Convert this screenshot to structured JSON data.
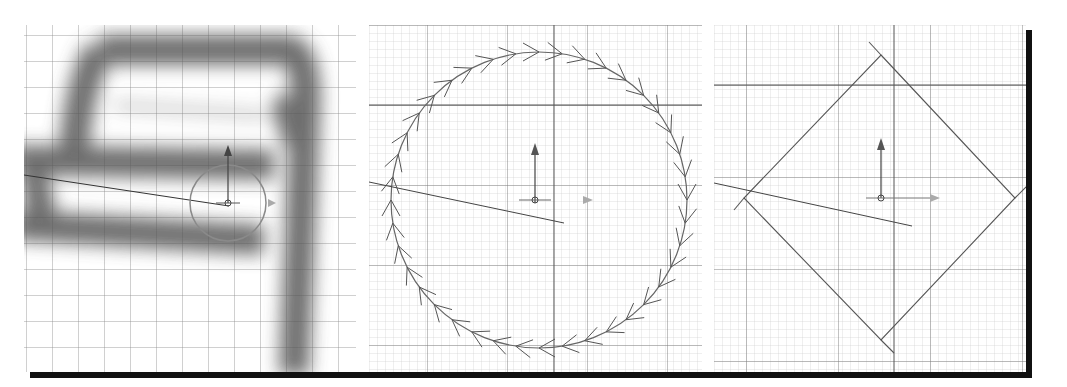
{
  "figure": {
    "panels": [
      {
        "id": "weight-preview",
        "label": "Blurred path weight preview with brush circle"
      },
      {
        "id": "circle-chevrons",
        "label": "Circular curve with direction chevrons"
      },
      {
        "id": "rotated-square",
        "label": "Rotated square outline"
      }
    ]
  },
  "colors": {
    "grid_minor": "#c8c8c8",
    "grid_major": "#6e6e6e",
    "stroke": "#555555",
    "shadow": "#111111",
    "blur_path": "#6a6a6a"
  }
}
